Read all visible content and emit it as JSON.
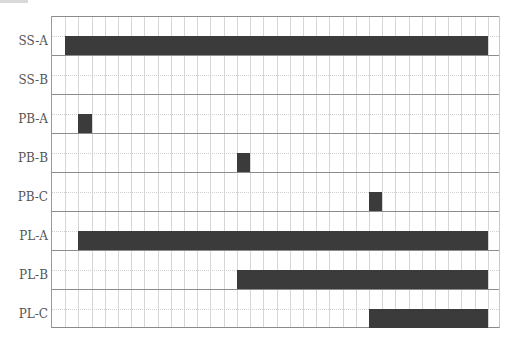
{
  "chart_data": {
    "type": "gantt",
    "title": "",
    "xlabel": "",
    "ylabel": "",
    "x_columns": 34,
    "grid": true,
    "categories": [
      "SS-A",
      "SS-B",
      "PB-A",
      "PB-B",
      "PB-C",
      "PL-A",
      "PL-B",
      "PL-C"
    ],
    "series": [
      {
        "name": "SS-A",
        "start": 1,
        "end": 33
      },
      {
        "name": "SS-B",
        "start": null,
        "end": null
      },
      {
        "name": "PB-A",
        "start": 2,
        "end": 3
      },
      {
        "name": "PB-B",
        "start": 14,
        "end": 15
      },
      {
        "name": "PB-C",
        "start": 24,
        "end": 25
      },
      {
        "name": "PL-A",
        "start": 2,
        "end": 33
      },
      {
        "name": "PL-B",
        "start": 14,
        "end": 33
      },
      {
        "name": "PL-C",
        "start": 24,
        "end": 33
      }
    ],
    "bar_color": "#3b3b3b"
  },
  "labels": {
    "r0": "SS-A",
    "r1": "SS-B",
    "r2": "PB-A",
    "r3": "PB-B",
    "r4": "PB-C",
    "r5": "PL-A",
    "r6": "PL-B",
    "r7": "PL-C"
  }
}
